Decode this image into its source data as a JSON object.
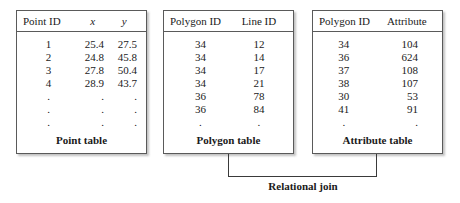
{
  "figure": {
    "join_label": "Relational join"
  },
  "tables": [
    {
      "id": "point-table",
      "caption": "Point table",
      "headers": [
        "Point ID",
        "x",
        "y"
      ],
      "header_italic": [
        false,
        true,
        true
      ],
      "rows": [
        [
          "1",
          "25.4",
          "27.5"
        ],
        [
          "2",
          "24.8",
          "45.8"
        ],
        [
          "3",
          "27.8",
          "50.4"
        ],
        [
          "4",
          "28.9",
          "43.7"
        ],
        [
          ".",
          ".",
          "."
        ],
        [
          ".",
          ".",
          "."
        ],
        [
          ".",
          ".",
          "."
        ]
      ]
    },
    {
      "id": "polygon-table",
      "caption": "Polygon table",
      "headers": [
        "Polygon ID",
        "Line ID"
      ],
      "header_italic": [
        false,
        false
      ],
      "rows": [
        [
          "34",
          "12"
        ],
        [
          "34",
          "14"
        ],
        [
          "34",
          "17"
        ],
        [
          "34",
          "21"
        ],
        [
          "36",
          "78"
        ],
        [
          "36",
          "84"
        ],
        [
          ".",
          "."
        ]
      ]
    },
    {
      "id": "attribute-table",
      "caption": "Attribute table",
      "headers": [
        "Polygon ID",
        "Attribute"
      ],
      "header_italic": [
        false,
        false
      ],
      "rows": [
        [
          "34",
          "104"
        ],
        [
          "36",
          "624"
        ],
        [
          "37",
          "108"
        ],
        [
          "38",
          "107"
        ],
        [
          "30",
          "53"
        ],
        [
          "41",
          "91"
        ],
        [
          ".",
          "."
        ]
      ]
    }
  ]
}
